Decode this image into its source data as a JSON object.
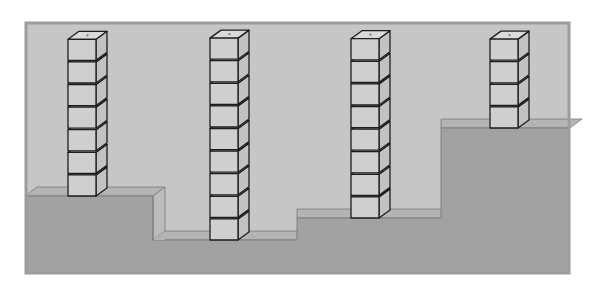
{
  "diagram": {
    "frame": {
      "x": 25,
      "y": 22,
      "width": 545,
      "height": 252
    },
    "colors": {
      "sky": "#c6c6c6",
      "frame_border": "#9c9c9c",
      "ground_front": "#a2a2a2",
      "ground_top": "#b4b4b4",
      "ground_side": "#bcbcbc",
      "block_front": "#cfcfcf",
      "block_top": "#dadada",
      "block_side": "#c2c2c2",
      "outline": "#1e1e1e"
    },
    "ground_levels": [
      {
        "name": "level-1",
        "x0": 25,
        "x1": 153,
        "top_y": 196
      },
      {
        "name": "level-2",
        "x0": 153,
        "x1": 297,
        "top_y": 240
      },
      {
        "name": "level-3",
        "x0": 297,
        "x1": 441,
        "top_y": 218
      },
      {
        "name": "level-4",
        "x0": 441,
        "x1": 570,
        "top_y": 128
      }
    ],
    "depth": {
      "dx": 12,
      "dy": 9
    },
    "towers": [
      {
        "name": "tower-1",
        "x": 68,
        "blocks": 7,
        "base_y": 196
      },
      {
        "name": "tower-2",
        "x": 210,
        "blocks": 9,
        "base_y": 240
      },
      {
        "name": "tower-3",
        "x": 351,
        "blocks": 8,
        "base_y": 218
      },
      {
        "name": "tower-4",
        "x": 490,
        "blocks": 4,
        "base_y": 128
      }
    ],
    "block": {
      "width": 28,
      "height": 22.6
    }
  }
}
